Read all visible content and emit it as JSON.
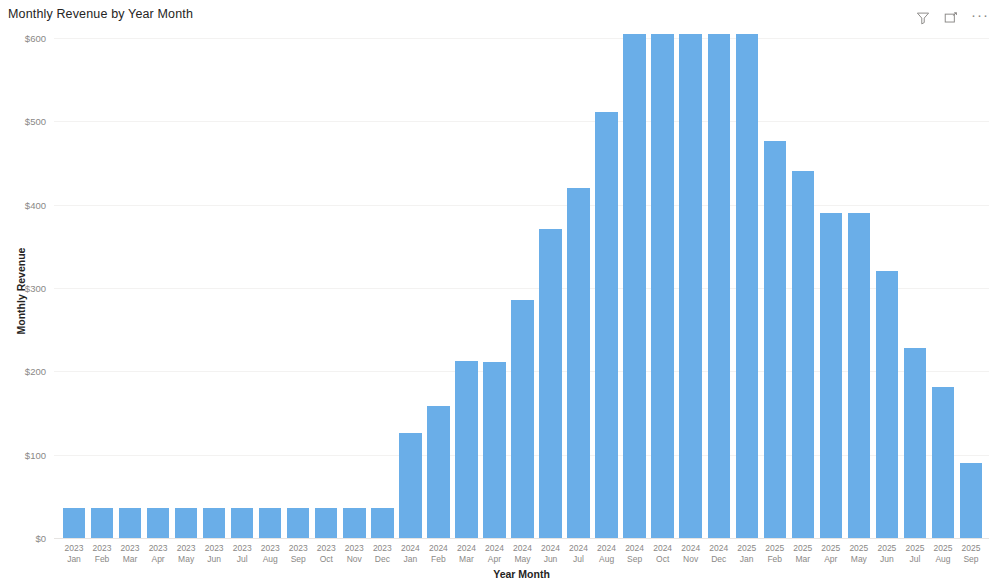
{
  "visual": {
    "title": "Monthly Revenue by Year Month",
    "header_icons": [
      {
        "name": "filter-icon",
        "label": "Filters"
      },
      {
        "name": "focus-mode-icon",
        "label": "Focus mode"
      },
      {
        "name": "more-options-icon",
        "label": "···"
      }
    ]
  },
  "chart_data": {
    "type": "bar",
    "title": "Monthly Revenue by Year Month",
    "xlabel": "Year Month",
    "ylabel": "Monthly Revenue",
    "ylim": [
      0,
      600
    ],
    "yticks": [
      0,
      100,
      200,
      300,
      400,
      500,
      600
    ],
    "ytick_labels": [
      "$0",
      "$100",
      "$200",
      "$300",
      "$400",
      "$500",
      "$600"
    ],
    "grid": true,
    "legend": null,
    "bar_color": "#6AAEE8",
    "categories": [
      "2023 Jan",
      "2023 Feb",
      "2023 Mar",
      "2023 Apr",
      "2023 May",
      "2023 Jun",
      "2023 Jul",
      "2023 Aug",
      "2023 Sep",
      "2023 Oct",
      "2023 Nov",
      "2023 Dec",
      "2024 Jan",
      "2024 Feb",
      "2024 Mar",
      "2024 Apr",
      "2024 May",
      "2024 Jun",
      "2024 Jul",
      "2024 Aug",
      "2024 Sep",
      "2024 Oct",
      "2024 Nov",
      "2024 Dec",
      "2025 Jan",
      "2025 Feb",
      "2025 Mar",
      "2025 Apr",
      "2025 May",
      "2025 Jun",
      "2025 Jul",
      "2025 Aug",
      "2025 Sep"
    ],
    "category_years": [
      "2023",
      "2023",
      "2023",
      "2023",
      "2023",
      "2023",
      "2023",
      "2023",
      "2023",
      "2023",
      "2023",
      "2023",
      "2024",
      "2024",
      "2024",
      "2024",
      "2024",
      "2024",
      "2024",
      "2024",
      "2024",
      "2024",
      "2024",
      "2024",
      "2025",
      "2025",
      "2025",
      "2025",
      "2025",
      "2025",
      "2025",
      "2025",
      "2025"
    ],
    "category_months": [
      "Jan",
      "Feb",
      "Mar",
      "Apr",
      "May",
      "Jun",
      "Jul",
      "Aug",
      "Sep",
      "Oct",
      "Nov",
      "Dec",
      "Jan",
      "Feb",
      "Mar",
      "Apr",
      "May",
      "Jun",
      "Jul",
      "Aug",
      "Sep",
      "Oct",
      "Nov",
      "Dec",
      "Jan",
      "Feb",
      "Mar",
      "Apr",
      "May",
      "Jun",
      "Jul",
      "Aug",
      "Sep"
    ],
    "values": [
      36,
      36,
      36,
      36,
      36,
      36,
      36,
      36,
      36,
      36,
      36,
      36,
      126,
      159,
      212,
      211,
      286,
      371,
      420,
      511,
      605,
      605,
      605,
      605,
      605,
      477,
      441,
      390,
      390,
      321,
      228,
      181,
      90
    ]
  }
}
